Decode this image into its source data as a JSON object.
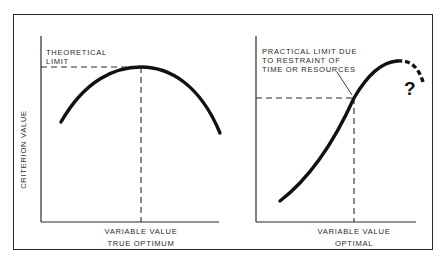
{
  "figure": {
    "y_axis_label": "CRITERION VALUE",
    "left_panel": {
      "annotation": "THEORETICAL\nLIMIT",
      "x_axis_label": "VARIABLE VALUE",
      "caption": "TRUE OPTIMUM",
      "curve_shape": "inverted parabola with single peak"
    },
    "right_panel": {
      "annotation": "PRACTICAL LIMIT DUE\nTO RESTRAINT OF\nTIME OR RESOURCES",
      "x_axis_label": "VARIABLE VALUE",
      "caption": "OPTIMAL",
      "uncertainty_mark": "?",
      "curve_shape": "rising S-curve with dashed uncertain continuation"
    }
  },
  "colors": {
    "ink": "#111111",
    "frame": "#2a2a2a",
    "background": "#ffffff"
  }
}
